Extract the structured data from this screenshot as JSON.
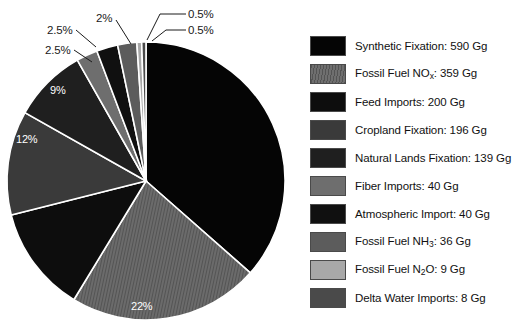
{
  "chart_data": {
    "type": "pie",
    "title": "",
    "unit": "Gg",
    "total": 1617,
    "start_angle_deg": 0,
    "direction": "clockwise",
    "legend_position": "right",
    "grid": false,
    "categories": [
      "Synthetic Fixation",
      "Fossil Fuel NOx",
      "Feed Imports",
      "Cropland Fixation",
      "Natural Lands Fixation",
      "Fiber Imports",
      "Atmospheric Import",
      "Fossil Fuel NH3",
      "Fossil Fuel N2O",
      "Delta Water Imports"
    ],
    "values": [
      590,
      359,
      200,
      196,
      139,
      40,
      40,
      36,
      9,
      8
    ],
    "percent_labels": [
      "36%",
      "22%",
      "12%",
      "12%",
      "9%",
      "2.5%",
      "2.5%",
      "2%",
      "0.5%",
      "0.5%"
    ],
    "colors": [
      "#050505",
      "#616161",
      "#0d0d0d",
      "#3a3a3a",
      "#1f1f1f",
      "#6e6e6e",
      "#101010",
      "#5c5c5c",
      "#a8a8a8",
      "#4a4a4a"
    ],
    "slices": [
      {
        "label": "Synthetic Fixation",
        "value": 590,
        "percent": 36.0,
        "color": "#050505",
        "pattern": "solid"
      },
      {
        "label": "Fossil Fuel NOx",
        "value": 359,
        "percent": 22.0,
        "color": "#616161",
        "pattern": "hatch"
      },
      {
        "label": "Feed Imports",
        "value": 200,
        "percent": 12.0,
        "color": "#0d0d0d",
        "pattern": "solid"
      },
      {
        "label": "Cropland Fixation",
        "value": 196,
        "percent": 12.0,
        "color": "#3a3a3a",
        "pattern": "solid"
      },
      {
        "label": "Natural Lands Fixation",
        "value": 139,
        "percent": 9.0,
        "color": "#1f1f1f",
        "pattern": "solid"
      },
      {
        "label": "Fiber Imports",
        "value": 40,
        "percent": 2.5,
        "color": "#6e6e6e",
        "pattern": "solid"
      },
      {
        "label": "Atmospheric Import",
        "value": 40,
        "percent": 2.5,
        "color": "#101010",
        "pattern": "solid"
      },
      {
        "label": "Fossil Fuel NH3",
        "value": 36,
        "percent": 2.0,
        "color": "#5c5c5c",
        "pattern": "solid"
      },
      {
        "label": "Fossil Fuel N2O",
        "value": 9,
        "percent": 0.5,
        "color": "#a8a8a8",
        "pattern": "solid"
      },
      {
        "label": "Delta Water Imports",
        "value": 8,
        "percent": 0.5,
        "color": "#4a4a4a",
        "pattern": "solid"
      }
    ]
  },
  "pie": {
    "callouts": [
      {
        "text": "0.5%",
        "x": 188,
        "y": 8
      },
      {
        "text": "0.5%",
        "x": 188,
        "y": 24
      },
      {
        "text": "2%",
        "x": 96,
        "y": 12
      },
      {
        "text": "2.5%",
        "x": 47,
        "y": 24
      },
      {
        "text": "2.5%",
        "x": 45,
        "y": 44
      }
    ],
    "inside_labels": [
      {
        "text": "9%",
        "x": 50,
        "y": 84
      },
      {
        "text": "12%",
        "x": 16,
        "y": 133
      },
      {
        "text": "22%",
        "x": 131,
        "y": 300
      }
    ]
  },
  "legend": {
    "items": [
      {
        "label_prefix": "Synthetic Fixation: 590 Gg",
        "sub": "",
        "label_suffix": "",
        "swatch_name": "legend-swatch-synthetic-fixation"
      },
      {
        "label_prefix": "Fossil Fuel NO",
        "sub": "x",
        "label_suffix": ": 359 Gg",
        "swatch_name": "legend-swatch-fossil-fuel-nox"
      },
      {
        "label_prefix": "Feed Imports: 200 Gg",
        "sub": "",
        "label_suffix": "",
        "swatch_name": "legend-swatch-feed-imports"
      },
      {
        "label_prefix": "Cropland Fixation: 196 Gg",
        "sub": "",
        "label_suffix": "",
        "swatch_name": "legend-swatch-cropland-fixation"
      },
      {
        "label_prefix": "Natural Lands Fixation: 139 Gg",
        "sub": "",
        "label_suffix": "",
        "swatch_name": "legend-swatch-natural-lands-fixation"
      },
      {
        "label_prefix": "Fiber Imports: 40 Gg",
        "sub": "",
        "label_suffix": "",
        "swatch_name": "legend-swatch-fiber-imports"
      },
      {
        "label_prefix": "Atmospheric Import: 40 Gg",
        "sub": "",
        "label_suffix": "",
        "swatch_name": "legend-swatch-atmospheric-import"
      },
      {
        "label_prefix": "Fossil Fuel NH",
        "sub": "3",
        "label_suffix": ": 36 Gg",
        "swatch_name": "legend-swatch-fossil-fuel-nh3"
      },
      {
        "label_prefix": "Fossil Fuel N",
        "sub": "2",
        "label_suffix": "O: 9 Gg",
        "swatch_name": "legend-swatch-fossil-fuel-n2o"
      },
      {
        "label_prefix": "Delta Water Imports: 8 Gg",
        "sub": "",
        "label_suffix": "",
        "swatch_name": "legend-swatch-delta-water-imports"
      }
    ]
  }
}
